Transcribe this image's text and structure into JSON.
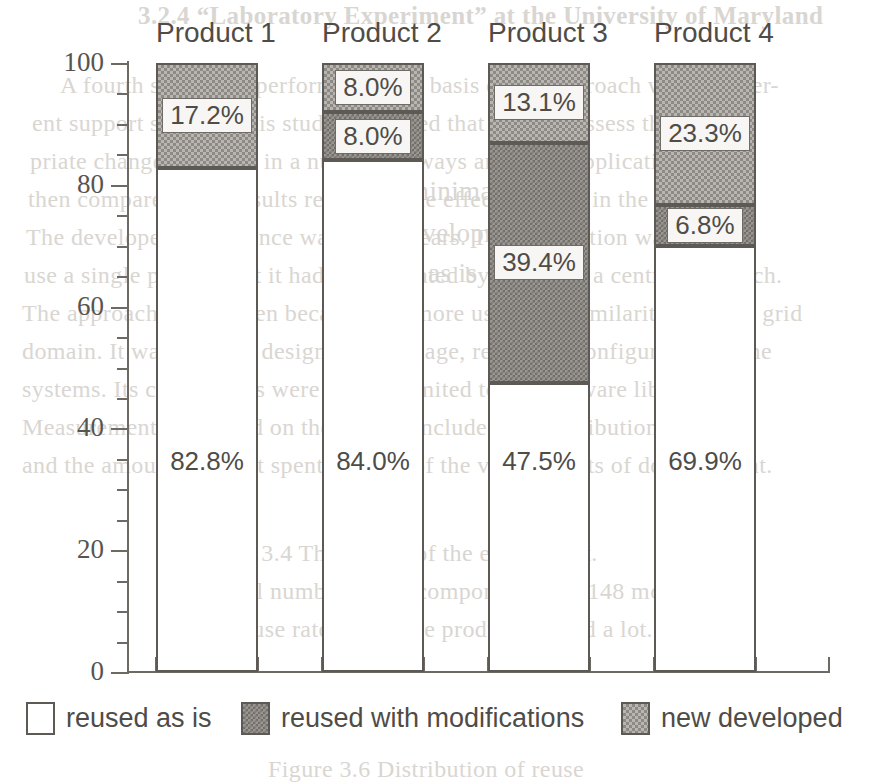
{
  "chart_data": {
    "type": "bar",
    "subtype": "stacked-100-percent",
    "title": "",
    "xlabel": "",
    "ylabel": "",
    "ylim": [
      0,
      100
    ],
    "y_major_ticks": [
      0,
      20,
      40,
      60,
      80,
      100
    ],
    "y_minor_tick_step": 5,
    "grid": false,
    "legend_position": "bottom",
    "categories": [
      "Product 1",
      "Product 2",
      "Product 3",
      "Product 4"
    ],
    "series": [
      {
        "name": "reused as is",
        "fill": "white",
        "values": [
          82.8,
          84.0,
          47.5,
          69.9
        ],
        "labels": [
          "82.8%",
          "84.0%",
          "47.5%",
          "69.9%"
        ],
        "label_boxed": false
      },
      {
        "name": "reused with modifications",
        "fill": "dense-checker",
        "values": [
          0.0,
          8.0,
          39.4,
          6.8
        ],
        "labels": [
          "",
          "8.0%",
          "39.4%",
          "6.8%"
        ],
        "label_boxed": true
      },
      {
        "name": "new developed",
        "fill": "light-stipple",
        "values": [
          17.2,
          8.0,
          13.1,
          23.3
        ],
        "labels": [
          "17.2%",
          "8.0%",
          "13.1%",
          "23.3%"
        ],
        "label_boxed": true
      }
    ]
  },
  "axis": {
    "y_tick_labels": [
      "100",
      "80",
      "60",
      "40",
      "20",
      "0"
    ]
  },
  "legend": {
    "items": [
      {
        "label": "reused as is",
        "swatch": "white-swatch"
      },
      {
        "label": "reused with modifications",
        "swatch": "dense-checker-swatch"
      },
      {
        "label": "new developed",
        "swatch": "light-stipple-swatch"
      }
    ]
  },
  "page_bleed_text": [
    {
      "text": "3.2.4  “Laboratory Experiment” at the University of Maryland",
      "x": 138,
      "y": 2,
      "size": 25,
      "bold": true
    },
    {
      "text": "A fourth study was performed as the basis of the approach with a differ-",
      "x": 60,
      "y": 72,
      "size": 24,
      "bold": false
    },
    {
      "text": "ent support system. This study suggested that one can assess the appro-",
      "x": 32,
      "y": 110,
      "size": 24,
      "bold": false
    },
    {
      "text": "priate change involved in a number of ways and in an application. It was",
      "x": 30,
      "y": 148,
      "size": 24,
      "bold": false
    },
    {
      "text": "then compared with results regarding the effect of reuse in the process.",
      "x": 28,
      "y": 186,
      "size": 24,
      "bold": false
    },
    {
      "text": "The developers experience was of six years.  The application was not re-",
      "x": 26,
      "y": 224,
      "size": 24,
      "bold": false
    },
    {
      "text": "use a single product but it had to be created by means of a central approach.",
      "x": 24,
      "y": 262,
      "size": 24,
      "bold": false
    },
    {
      "text": "The approach was chosen because it is more usual and similarity with the grid",
      "x": 22,
      "y": 300,
      "size": 24,
      "bold": false
    },
    {
      "text": "domain. It was actually designed to manage, reuse and configuration of the",
      "x": 22,
      "y": 338,
      "size": 24,
      "bold": false
    },
    {
      "text": "systems. Its components were not the limited to the software libraries.",
      "x": 22,
      "y": 376,
      "size": 24,
      "bold": false
    },
    {
      "text": "Measurements collected on the project included the distribution of reuse",
      "x": 22,
      "y": 414,
      "size": 24,
      "bold": false
    },
    {
      "text": "and the amount of effort spent on each of the various sorts of development.",
      "x": 22,
      "y": 452,
      "size": 24,
      "bold": false
    },
    {
      "text": "minimal",
      "x": 408,
      "y": 176,
      "size": 27,
      "bold": false
    },
    {
      "text": "development",
      "x": 396,
      "y": 218,
      "size": 27,
      "bold": false
    },
    {
      "text": "reuse as is",
      "x": 362,
      "y": 258,
      "size": 27,
      "bold": false
    },
    {
      "text": "Table 3.4    The results of the experiment.",
      "x": 200,
      "y": 540,
      "size": 24,
      "bold": false
    },
    {
      "text": "The total number of the components was 148 modules.",
      "x": 174,
      "y": 578,
      "size": 24,
      "bold": false
    },
    {
      "text": "The reuse rate across the products varied a lot.",
      "x": 188,
      "y": 616,
      "size": 24,
      "bold": false
    },
    {
      "text": "Figure 3.6  Distribution of reuse",
      "x": 268,
      "y": 756,
      "size": 24,
      "bold": false
    }
  ]
}
